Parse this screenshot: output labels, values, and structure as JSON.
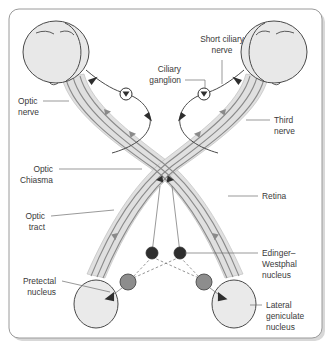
{
  "figure": {
    "background_color": "#ffffff",
    "frame_color": "#9a9a9a"
  },
  "labels": {
    "optic_nerve": "Optic\nnerve",
    "optic_nerve_line1": "Optic",
    "optic_nerve_line2": "nerve",
    "optic_chiasma_line1": "Optic",
    "optic_chiasma_line2": "Chiasma",
    "optic_tract_line1": "Optic",
    "optic_tract_line2": "tract",
    "pretectal_line1": "Pretectal",
    "pretectal_line2": "nucleus",
    "short_ciliary_line1": "Short ciliary",
    "short_ciliary_line2": "nerve",
    "ciliary_ganglion_line1": "Ciliary",
    "ciliary_ganglion_line2": "ganglion",
    "third_nerve_line1": "Third",
    "third_nerve_line2": "nerve",
    "retina": "Retina",
    "edinger_westphal_line1": "Edinger–",
    "edinger_westphal_line2": "Westphal",
    "edinger_westphal_line3": "nucleus",
    "lateral_geniculate_line1": "Lateral",
    "lateral_geniculate_line2": "geniculate",
    "lateral_geniculate_line3": "nucleus"
  },
  "structures": {
    "left_eye": "left-eye",
    "right_eye": "right-eye",
    "left_pretectal_nucleus": "left-pretectal-nucleus",
    "right_lateral_geniculate_nucleus": "right-lateral-geniculate-nucleus",
    "left_ciliary_ganglion": "left-ciliary-ganglion",
    "right_ciliary_ganglion": "right-ciliary-ganglion",
    "chiasma": "optic-chiasma-crossing"
  },
  "colors": {
    "eye_fill": "#e8e8e8",
    "tract_fill": "#e0e0e0",
    "fiber_stroke": "#8a8a8a",
    "node_gray": "#8d8d8d",
    "node_dark": "#2e2e2e",
    "outline": "#4a4a4a",
    "text": "#3a3a3a"
  },
  "label_text_size_px": 8.4
}
